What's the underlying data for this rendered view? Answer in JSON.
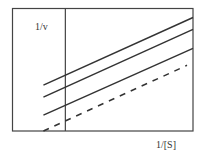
{
  "chart_data": {
    "type": "line",
    "title": "",
    "xlabel": "1/[S]",
    "ylabel": "1/v",
    "grid": false,
    "legend": null,
    "xlim": [
      -1.06,
      2.56
    ],
    "ylim": [
      0,
      2.46
    ],
    "y_axis_at_x": 0,
    "series": [
      {
        "name": "line-1",
        "style": "solid",
        "x": [
          -0.44,
          2.56
        ],
        "y": [
          0.92,
          2.28
        ]
      },
      {
        "name": "line-2",
        "style": "solid",
        "x": [
          -0.44,
          2.56
        ],
        "y": [
          0.68,
          2.04
        ]
      },
      {
        "name": "line-3",
        "style": "solid",
        "x": [
          -0.44,
          2.56
        ],
        "y": [
          0.32,
          1.66
        ]
      },
      {
        "name": "line-4",
        "style": "dashed",
        "x": [
          -0.44,
          2.44
        ],
        "y": [
          0.0,
          1.32
        ]
      }
    ]
  },
  "colors": {
    "line": "#333333",
    "frame": "#444444"
  }
}
